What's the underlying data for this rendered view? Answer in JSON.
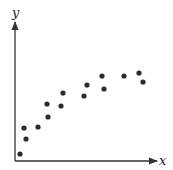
{
  "chart_data": {
    "type": "scatter",
    "title": "",
    "xlabel": "x",
    "ylabel": "y",
    "x_ticks": [],
    "y_ticks": [],
    "grid": false,
    "legend": null,
    "xlim": [
      0,
      142
    ],
    "ylim": [
      0,
      139
    ],
    "units_note": "No tick labels shown; values are relative positions (pixels from origin).",
    "series": [
      {
        "name": "points",
        "color": "#2b2b2b",
        "points": [
          {
            "x": 5,
            "y": 7
          },
          {
            "x": 11,
            "y": 22
          },
          {
            "x": 9,
            "y": 33
          },
          {
            "x": 23,
            "y": 34
          },
          {
            "x": 33,
            "y": 44
          },
          {
            "x": 32,
            "y": 57
          },
          {
            "x": 46,
            "y": 55
          },
          {
            "x": 48,
            "y": 68
          },
          {
            "x": 69,
            "y": 65
          },
          {
            "x": 72,
            "y": 76
          },
          {
            "x": 89,
            "y": 72
          },
          {
            "x": 87,
            "y": 85
          },
          {
            "x": 109,
            "y": 85
          },
          {
            "x": 124,
            "y": 88
          },
          {
            "x": 128,
            "y": 79
          }
        ]
      }
    ]
  },
  "layout": {
    "origin_px": [
      15,
      161
    ],
    "x_axis_end_px": 157,
    "y_axis_end_px": 22,
    "axis_color": "#333333",
    "point_radius": 2.6
  }
}
